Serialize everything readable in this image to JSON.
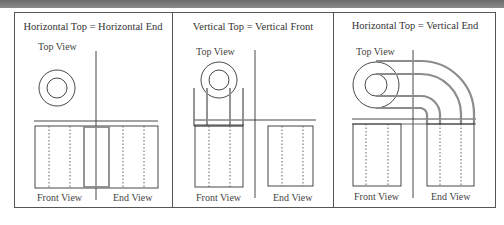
{
  "diagram": {
    "panels": [
      {
        "title": "Horizontal Top = Horizontal End",
        "labels": {
          "top": "Top View",
          "front": "Front View",
          "end": "End View"
        }
      },
      {
        "title": "Vertical Top = Vertical Front",
        "labels": {
          "top": "Top View",
          "front": "Front View",
          "end": "End View"
        }
      },
      {
        "title": "Horizontal Top = Vertical End",
        "labels": {
          "top": "Top View",
          "front": "Front View",
          "end": "End View"
        }
      }
    ],
    "colors": {
      "line": "#333333",
      "projection": "#8c8c8c",
      "header_band": "#7a7a7a"
    }
  }
}
